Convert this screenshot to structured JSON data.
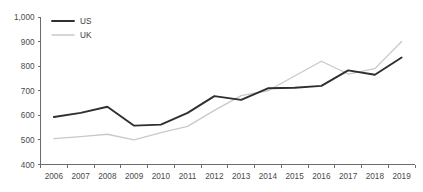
{
  "chart_data": {
    "type": "line",
    "title": "",
    "subtitle": "",
    "xlabel": "",
    "ylabel": "",
    "categories": [
      "2006",
      "2007",
      "2008",
      "2009",
      "2010",
      "2011",
      "2012",
      "2013",
      "2014",
      "2015",
      "2016",
      "2017",
      "2018",
      "2019"
    ],
    "x": [
      2006,
      2007,
      2008,
      2009,
      2010,
      2011,
      2012,
      2013,
      2014,
      2015,
      2016,
      2017,
      2018,
      2019
    ],
    "series": [
      {
        "name": "US",
        "color": "#2f2f2f",
        "values": [
          593,
          610,
          635,
          558,
          562,
          610,
          678,
          663,
          710,
          712,
          720,
          783,
          765,
          835
        ]
      },
      {
        "name": "UK",
        "color": "#c9c9c9",
        "values": [
          505,
          513,
          523,
          500,
          530,
          555,
          620,
          680,
          700,
          760,
          820,
          768,
          790,
          900
        ]
      }
    ],
    "ylim": [
      400,
      1000
    ],
    "ytick_values": [
      400,
      500,
      600,
      700,
      800,
      900,
      1000
    ],
    "ytick_labels": [
      "400",
      "500",
      "600",
      "700",
      "800",
      "900",
      "1,000"
    ],
    "xtick_labels": [
      "2006",
      "2007",
      "2008",
      "2009",
      "2010",
      "2011",
      "2012",
      "2013",
      "2014",
      "2015",
      "2016",
      "2017",
      "2018",
      "2019"
    ],
    "grid": false,
    "legend_position": "top-left",
    "legend_entries": [
      "US",
      "UK"
    ]
  },
  "legend": {
    "items": [
      {
        "label": "US",
        "color": "#2f2f2f"
      },
      {
        "label": "UK",
        "color": "#c9c9c9"
      }
    ]
  },
  "axes": {
    "y": {
      "labels": [
        "1,000",
        "900",
        "800",
        "700",
        "600",
        "500",
        "400"
      ]
    },
    "x": {
      "labels": [
        "2006",
        "2007",
        "2008",
        "2009",
        "2010",
        "2011",
        "2012",
        "2013",
        "2014",
        "2015",
        "2016",
        "2017",
        "2018",
        "2019"
      ]
    }
  }
}
